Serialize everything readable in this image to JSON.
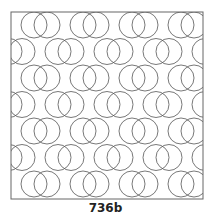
{
  "figure": {
    "caption": "736b"
  },
  "pattern": {
    "frame": {
      "x": 11,
      "y": 12,
      "width": 192,
      "height": 187
    },
    "circle_radius": 13,
    "row_centers_y": [
      25,
      51.5,
      78,
      104.5,
      131,
      157.5,
      184
    ],
    "odd_row_pair_left_x": [
      34,
      83,
      132,
      181
    ],
    "even_row_pair_left_x": [
      -40,
      9,
      58,
      107,
      156,
      205
    ],
    "pair_offset_x": 13,
    "stroke_color": "#555555",
    "frame_color": "#666666",
    "background": "#ffffff"
  }
}
